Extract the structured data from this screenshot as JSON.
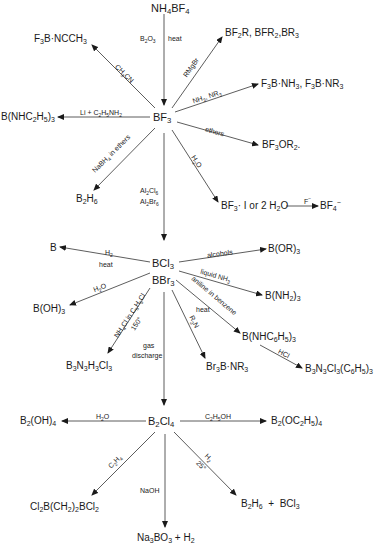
{
  "nodes": {
    "nh4bf4": "NH4BF4",
    "f3b_ncch3": "F3B·NCCH3",
    "bf2r": "BF2R, BFR2, BR3",
    "f3b_nh3": "F3B·NH3, F3B·NR3",
    "b_nhc2h5": "B(NHC2H5)3",
    "bf3": "BF3",
    "bf3or2": "BF3OR2",
    "b2h6_top": "B2H6",
    "bf3_h2o": "BF3·1 or 2H2O",
    "bf4": "BF4−",
    "b": "B",
    "bcl3": "BCl3",
    "bbr3": "BBr3",
    "b_or3": "B(OR)3",
    "b_oh3": "B(OH)3",
    "b_nh2_3": "B(NH2)3",
    "b_nhc6h5": "B(NHC6H5)3",
    "b3n3h3cl3": "B3N3H3Cl3",
    "br3b_nr3": "Br3B·NR3",
    "b3n3cl3": "B3N3Cl3(C6H5)3",
    "b2oh4": "B2(OH)4",
    "b2cl4": "B2Cl4",
    "b2oc2h5": "B2(OC2H5)4",
    "cl2b": "Cl2B(CH2)2BCl2",
    "b2h6_bcl3": "B2H6 + BCl3",
    "na3bo3": "Na3BO3 + H2"
  },
  "labels": {
    "b2o3": "B2O3",
    "heat": "heat",
    "ch3cn": "CH3CN",
    "rmgbr": "RMgBr",
    "nh3_nr3": "NH3, NR3",
    "li": "Li + C2H5NH2",
    "ethers": "ethers",
    "nabh4": "NaBH4 in ethers",
    "h2o_bf3": "H2O",
    "al2cl6": "Al2Cl6",
    "al2br6": "Al2Br6",
    "f_minus": "F−",
    "h2": "H2",
    "heat_b": "heat",
    "alcohols": "alcohols",
    "liquid_nh3": "liquid NH3",
    "h2o_bcl3": "H2O",
    "aniline": "aniline in benzene",
    "heat_aniline": "heat",
    "nh4cl": "NH4Cl in C6H5Cl",
    "temp150": "150°",
    "r3n": "R3N",
    "gas": "gas",
    "discharge": "discharge",
    "hcl": "HCl",
    "h2o_b2cl4": "H2O",
    "c2h5oh": "C2H5OH",
    "c2h4": "C2H4",
    "naoh": "NaOH",
    "h2_b2": "H2",
    "temp25": "25°"
  }
}
